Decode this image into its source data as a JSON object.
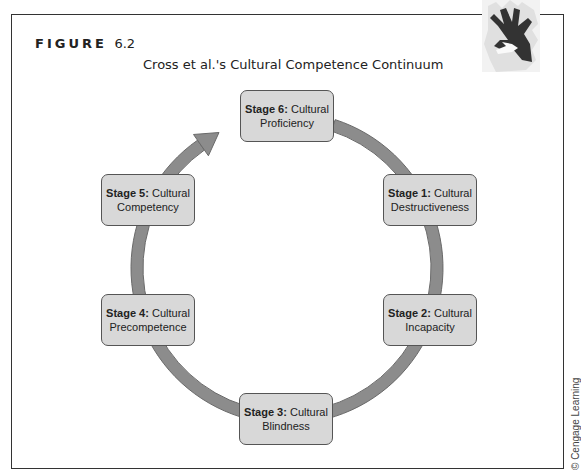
{
  "figure": {
    "label": "FIGURE",
    "number": "6.2",
    "title": "Cross et al.'s Cultural Competence Continuum",
    "credit": "© Cengage Learning",
    "decoration_icon": "hands-icon"
  },
  "colors": {
    "stage_fill": "#d8d8d8",
    "stage_border": "#555555",
    "arc": "#8c8c8c",
    "arc_edge": "#6a6a6a",
    "frame": "#333333"
  },
  "stages": [
    {
      "id": "stage-6",
      "prefix": "Stage 6:",
      "line1": "Cultural",
      "line2": "Proficiency"
    },
    {
      "id": "stage-1",
      "prefix": "Stage 1:",
      "line1": "Cultural",
      "line2": "Destructiveness"
    },
    {
      "id": "stage-2",
      "prefix": "Stage 2:",
      "line1": "Cultural",
      "line2": "Incapacity"
    },
    {
      "id": "stage-3",
      "prefix": "Stage 3:",
      "line1": "Cultural",
      "line2": "Blindness"
    },
    {
      "id": "stage-4",
      "prefix": "Stage 4:",
      "line1": "Cultural",
      "line2": "Precompetence"
    },
    {
      "id": "stage-5",
      "prefix": "Stage 5:",
      "line1": "Cultural",
      "line2": "Competency"
    }
  ],
  "cycle": {
    "direction": "clockwise",
    "order": [
      "Stage 1",
      "Stage 2",
      "Stage 3",
      "Stage 4",
      "Stage 5",
      "Stage 6"
    ],
    "arrowhead_target": "Stage 6"
  }
}
